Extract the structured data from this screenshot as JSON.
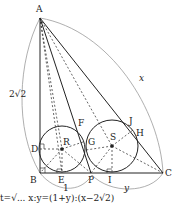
{
  "diagram": {
    "points": {
      "A": "A",
      "B": "B",
      "C": "C",
      "D": "D",
      "E": "E",
      "F": "F",
      "G": "G",
      "H": "H",
      "I": "I",
      "J": "J",
      "P": "P",
      "R": "R",
      "S": "S"
    },
    "measures": {
      "AB": "2√2",
      "AC": "x",
      "BP": "1",
      "PC": "y"
    },
    "caption": "t=√... x:y=(1+y):(x−2√2)",
    "colors": {
      "line": "#222222",
      "arc": "#9a9a9a"
    }
  }
}
